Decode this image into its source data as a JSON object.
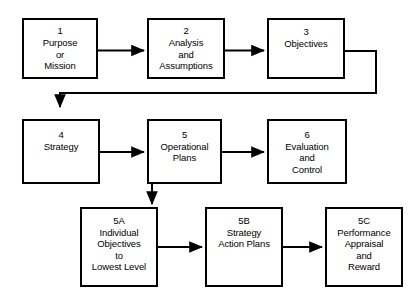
{
  "diagram": {
    "background_color": "#ffffff",
    "line_color": "#000000",
    "box_fill": "#ffffff",
    "nodes": [
      {
        "id": "n1",
        "number": "1",
        "label": "Purpose\nor\nMission"
      },
      {
        "id": "n2",
        "number": "2",
        "label": "Analysis\nand\nAssumptions"
      },
      {
        "id": "n3",
        "number": "3",
        "label": "Objectives"
      },
      {
        "id": "n4",
        "number": "4",
        "label": "Strategy"
      },
      {
        "id": "n5",
        "number": "5",
        "label": "Operational\nPlans"
      },
      {
        "id": "n6",
        "number": "6",
        "label": "Evaluation\nand\nControl"
      },
      {
        "id": "n5a",
        "number": "5A",
        "label": "Individual\nObjectives\nto\nLowest Level"
      },
      {
        "id": "n5b",
        "number": "5B",
        "label": "Strategy\nAction Plans"
      },
      {
        "id": "n5c",
        "number": "5C",
        "label": "Performance\nAppraisal\nand\nReward"
      }
    ],
    "connectors": [
      {
        "id": "c1",
        "from": "1",
        "to": "2",
        "kind": "arrow-right"
      },
      {
        "id": "c2",
        "from": "2",
        "to": "3",
        "kind": "arrow-right"
      },
      {
        "id": "c3",
        "from": "3",
        "to": "4",
        "kind": "feedback-down-left"
      },
      {
        "id": "c4",
        "from": "4",
        "to": "5",
        "kind": "arrow-right"
      },
      {
        "id": "c5",
        "from": "5",
        "to": "6",
        "kind": "arrow-right"
      },
      {
        "id": "c6",
        "from": "5",
        "to": "5A",
        "kind": "arrow-down"
      },
      {
        "id": "c7",
        "from": "5A",
        "to": "5B",
        "kind": "arrow-right"
      },
      {
        "id": "c8",
        "from": "5B",
        "to": "5C",
        "kind": "arrow-right"
      }
    ]
  }
}
